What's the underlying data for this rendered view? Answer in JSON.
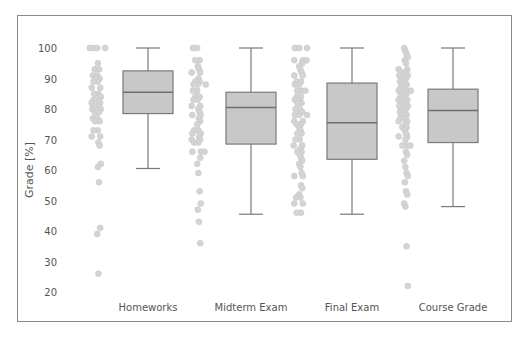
{
  "chart_data": {
    "type": "box",
    "title": "",
    "xlabel": "",
    "ylabel": "Grade [%]",
    "ylim": [
      17,
      103
    ],
    "yticks": [
      20,
      30,
      40,
      50,
      60,
      70,
      80,
      90,
      100
    ],
    "grid": false,
    "legend": null,
    "categories": [
      "Homeworks",
      "Midterm Exam",
      "Final Exam",
      "Course Grade"
    ],
    "boxes": [
      {
        "name": "Homeworks",
        "whisker_low": 60.5,
        "q1": 78.5,
        "median": 85.5,
        "q3": 92.5,
        "whisker_high": 100
      },
      {
        "name": "Midterm Exam",
        "whisker_low": 45.5,
        "q1": 68.5,
        "median": 80.5,
        "q3": 85.5,
        "whisker_high": 100
      },
      {
        "name": "Final Exam",
        "whisker_low": 45.5,
        "q1": 63.5,
        "median": 75.5,
        "q3": 88.5,
        "whisker_high": 100
      },
      {
        "name": "Course Grade",
        "whisker_low": 48,
        "q1": 69,
        "median": 79.5,
        "q3": 86.5,
        "whisker_high": 100
      }
    ],
    "strip_points": [
      {
        "name": "Homeworks",
        "values": [
          100,
          100,
          100,
          100,
          95,
          93,
          93,
          91,
          91,
          90,
          90,
          89,
          89,
          87,
          87,
          85,
          85,
          84,
          83,
          83,
          82,
          82,
          81,
          81,
          80,
          80,
          79,
          79,
          77,
          77,
          76,
          76,
          73,
          73,
          71,
          71,
          69,
          68,
          62,
          61,
          56,
          41,
          39,
          26
        ]
      },
      {
        "name": "Midterm Exam",
        "values": [
          100,
          100,
          96,
          96,
          94,
          93,
          92,
          92,
          90,
          89,
          89,
          88,
          88,
          88,
          86,
          86,
          84,
          84,
          83,
          83,
          81,
          81,
          80,
          79,
          78,
          78,
          77,
          76,
          75,
          73,
          73,
          72,
          72,
          71,
          70,
          70,
          69,
          69,
          66,
          66,
          66,
          64,
          62,
          59,
          53,
          49,
          47,
          43,
          36
        ]
      },
      {
        "name": "Final Exam",
        "values": [
          100,
          100,
          100,
          96,
          96,
          96,
          95,
          94,
          93,
          92,
          91,
          91,
          89,
          89,
          88,
          88,
          86,
          86,
          86,
          84,
          84,
          83,
          83,
          82,
          82,
          80,
          80,
          79,
          78,
          78,
          78,
          76,
          76,
          75,
          75,
          74,
          73,
          72,
          72,
          70,
          70,
          68,
          68,
          67,
          66,
          66,
          65,
          64,
          63,
          62,
          61,
          59,
          58,
          58,
          55,
          54,
          52,
          51,
          51,
          49,
          49,
          46,
          46
        ]
      },
      {
        "name": "Course Grade",
        "values": [
          100,
          99,
          98,
          97,
          96,
          95,
          93,
          93,
          92,
          92,
          91,
          91,
          90,
          90,
          89,
          89,
          88,
          88,
          87,
          87,
          86,
          86,
          86,
          85,
          85,
          84,
          84,
          83,
          83,
          82,
          82,
          81,
          81,
          80,
          80,
          79,
          79,
          78,
          78,
          77,
          77,
          76,
          76,
          75,
          74,
          74,
          73,
          72,
          71,
          71,
          70,
          68,
          68,
          68,
          66,
          65,
          63,
          61,
          59,
          58,
          56,
          53,
          52,
          49,
          48,
          35,
          22
        ]
      }
    ],
    "colors": {
      "box_fill": "#c8c8c8",
      "box_stroke": "#7a7a7a",
      "median": "#6e6e6e",
      "whisker": "#7a7a7a",
      "point": "#d4d4d4",
      "frame": "#8a8a8a",
      "text": "#555555"
    }
  }
}
